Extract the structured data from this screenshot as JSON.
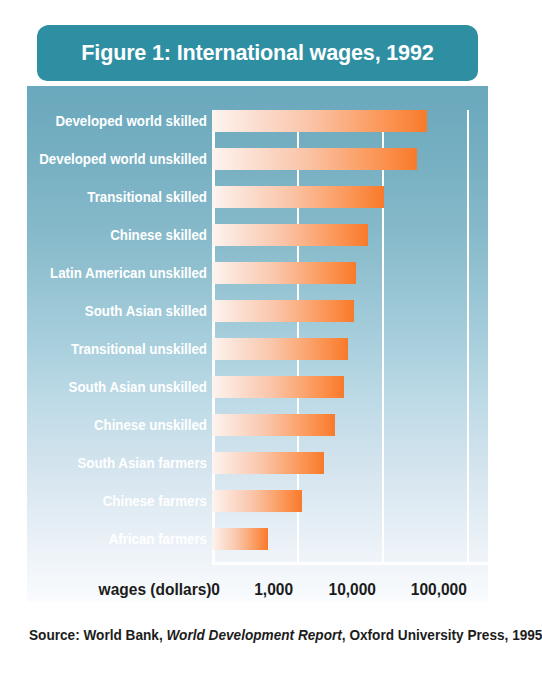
{
  "figure": {
    "title": "Figure 1: International wages, 1992",
    "source_prefix": "Source: World Bank, ",
    "source_italic": "World Development Report",
    "source_suffix": ", Oxford University Press, 1995",
    "axis_title": "wages (dollars)",
    "panel_top_color": "#6aa8bd",
    "panel_bottom_color": "#fafcfe",
    "banner_color": "#2e8fa3",
    "bar_start_color": "#fdf4f0",
    "bar_end_color": "#f87a2b",
    "gridline_color": "#ffffff",
    "label_color": "#ffffff",
    "text_color": "#1c1c1c"
  },
  "chart_data": {
    "type": "bar",
    "orientation": "horizontal",
    "title": "Figure 1: International wages, 1992",
    "xlabel": "wages (dollars)",
    "ylabel": "",
    "xscale": "log",
    "xlim": [
      0,
      100000
    ],
    "xticks": [
      0,
      1000,
      10000,
      100000
    ],
    "xtick_labels": [
      "0",
      "1,000",
      "10,000",
      "100,000"
    ],
    "grid": true,
    "legend": false,
    "units": "US dollars per year",
    "categories": [
      "Developed world skilled",
      "Developed world unskilled",
      "Transitional skilled",
      "Chinese skilled",
      "Latin American unskilled",
      "South Asian skilled",
      "Transitional unskilled",
      "South Asian unskilled",
      "Chinese unskilled",
      "South Asian farmers",
      "Chinese farmers",
      "African farmers"
    ],
    "values": [
      45000,
      33000,
      10600,
      6500,
      4600,
      4400,
      3600,
      3200,
      2400,
      1750,
      1100,
      500
    ],
    "bar_pixel_widths": [
      215,
      205,
      172,
      156,
      144,
      142,
      136,
      132,
      123,
      112,
      90,
      56
    ]
  },
  "axis_positions": {
    "tick_px": [
      0,
      85,
      170,
      255
    ],
    "tick_label_left_px": [
      211,
      253,
      327,
      409
    ]
  }
}
